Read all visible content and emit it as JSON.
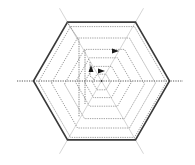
{
  "diagram": {
    "title": "",
    "type": "hexagonal-spiral",
    "hexagon_count": 7,
    "arrow_count": 3,
    "colors": {
      "outer_hexagon": "#3a3a3a",
      "inner_hexagons": "#8a8a8a",
      "axis_faint": "#d6d6d6",
      "horizontal_axis": "#555555",
      "arrows": "#1a1a1a"
    },
    "icons": [
      "arrow-right-icon",
      "arrow-right-icon",
      "arrow-up-icon"
    ]
  }
}
